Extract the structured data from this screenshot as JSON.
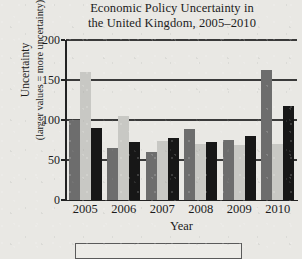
{
  "chart_data": {
    "type": "bar",
    "title": "Economic Policy Uncertainty in the United Kingdom, 2005–2010",
    "title_line1": "Economic Policy Uncertainty in",
    "title_line2": "the United Kingdom, 2005–2010",
    "xlabel": "Year",
    "ylabel": "Uncertainty",
    "ylabel_line1": "Uncertainty",
    "ylabel_line2": "(larger values = more uncertainty)",
    "categories": [
      "2005",
      "2006",
      "2007",
      "2008",
      "2009",
      "2010"
    ],
    "ylim": [
      0,
      200
    ],
    "yticks": [
      0,
      50,
      100,
      150,
      200
    ],
    "ytick_labels": [
      "0",
      "50",
      "100",
      "150",
      "200"
    ],
    "grid": true,
    "grid_axis": "y",
    "legend": "none",
    "series": [
      {
        "name": "series-1",
        "color": "#6d6d6d",
        "values": [
          100,
          65,
          60,
          89,
          75,
          163
        ]
      },
      {
        "name": "series-2",
        "color": "#c8c8c4",
        "values": [
          160,
          105,
          74,
          70,
          69,
          70
        ]
      },
      {
        "name": "series-3",
        "color": "#171717",
        "values": [
          90,
          72,
          77,
          72,
          80,
          117
        ]
      }
    ]
  }
}
